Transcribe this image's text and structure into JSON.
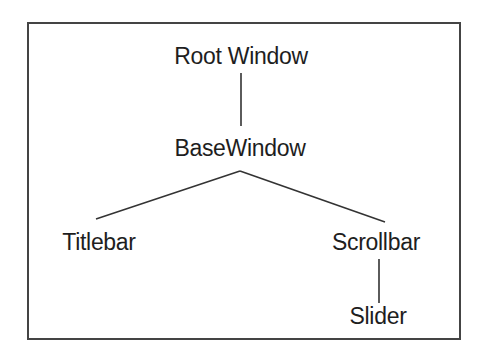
{
  "diagram": {
    "type": "tree",
    "colors": {
      "border": "#444444",
      "line": "#333333",
      "text": "#1e1e1e",
      "background": "#ffffff"
    },
    "nodes": [
      {
        "id": "root",
        "label": "Root Window",
        "x": 241,
        "y": 45
      },
      {
        "id": "base",
        "label": "BaseWindow",
        "x": 240,
        "y": 137
      },
      {
        "id": "titlebar",
        "label": "Titlebar",
        "x": 99,
        "y": 231
      },
      {
        "id": "scrollbar",
        "label": "Scrollbar",
        "x": 376,
        "y": 231
      },
      {
        "id": "slider",
        "label": "Slider",
        "x": 378,
        "y": 305
      }
    ],
    "edges": [
      {
        "from": "root",
        "to": "base"
      },
      {
        "from": "base",
        "to": "titlebar"
      },
      {
        "from": "base",
        "to": "scrollbar"
      },
      {
        "from": "scrollbar",
        "to": "slider"
      }
    ]
  }
}
